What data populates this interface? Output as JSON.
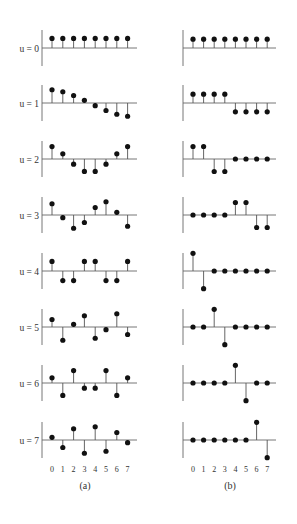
{
  "chart_data": [
    {
      "type": "stem",
      "title": "",
      "caption": "(a)",
      "description": "8-point DCT basis functions",
      "x": [
        0,
        1,
        2,
        3,
        4,
        5,
        6,
        7
      ],
      "xlabel": "",
      "ylabel": "",
      "tick_labels": [
        "0",
        "1",
        "2",
        "3",
        "4",
        "5",
        "6",
        "7"
      ],
      "series": [
        {
          "name": "u = 0",
          "values": [
            0.354,
            0.354,
            0.354,
            0.354,
            0.354,
            0.354,
            0.354,
            0.354
          ]
        },
        {
          "name": "u = 1",
          "values": [
            0.49,
            0.416,
            0.278,
            0.098,
            -0.098,
            -0.278,
            -0.416,
            -0.49
          ]
        },
        {
          "name": "u = 2",
          "values": [
            0.462,
            0.191,
            -0.191,
            -0.462,
            -0.462,
            -0.191,
            0.191,
            0.462
          ]
        },
        {
          "name": "u = 3",
          "values": [
            0.416,
            -0.098,
            -0.49,
            -0.278,
            0.278,
            0.49,
            0.098,
            -0.416
          ]
        },
        {
          "name": "u = 4",
          "values": [
            0.354,
            -0.354,
            -0.354,
            0.354,
            0.354,
            -0.354,
            -0.354,
            0.354
          ]
        },
        {
          "name": "u = 5",
          "values": [
            0.278,
            -0.49,
            0.098,
            0.416,
            -0.416,
            -0.098,
            0.49,
            -0.278
          ]
        },
        {
          "name": "u = 6",
          "values": [
            0.191,
            -0.462,
            0.462,
            -0.191,
            -0.191,
            0.462,
            -0.462,
            0.191
          ]
        },
        {
          "name": "u = 7",
          "values": [
            0.098,
            -0.278,
            0.416,
            -0.49,
            0.49,
            -0.416,
            0.278,
            -0.098
          ]
        }
      ]
    },
    {
      "type": "stem",
      "title": "",
      "caption": "(b)",
      "description": "8-point Haar basis functions",
      "x": [
        0,
        1,
        2,
        3,
        4,
        5,
        6,
        7
      ],
      "xlabel": "",
      "ylabel": "",
      "tick_labels": [
        "0",
        "1",
        "2",
        "3",
        "4",
        "5",
        "6",
        "7"
      ],
      "series": [
        {
          "name": "u = 0",
          "values": [
            0.354,
            0.354,
            0.354,
            0.354,
            0.354,
            0.354,
            0.354,
            0.354
          ]
        },
        {
          "name": "u = 1",
          "values": [
            0.354,
            0.354,
            0.354,
            0.354,
            -0.354,
            -0.354,
            -0.354,
            -0.354
          ]
        },
        {
          "name": "u = 2",
          "values": [
            0.5,
            0.5,
            -0.5,
            -0.5,
            0,
            0,
            0,
            0
          ]
        },
        {
          "name": "u = 3",
          "values": [
            0,
            0,
            0,
            0,
            0.5,
            0.5,
            -0.5,
            -0.5
          ]
        },
        {
          "name": "u = 4",
          "values": [
            0.707,
            -0.707,
            0,
            0,
            0,
            0,
            0,
            0
          ]
        },
        {
          "name": "u = 5",
          "values": [
            0,
            0,
            0.707,
            -0.707,
            0,
            0,
            0,
            0
          ]
        },
        {
          "name": "u = 6",
          "values": [
            0,
            0,
            0,
            0,
            0.707,
            -0.707,
            0,
            0
          ]
        },
        {
          "name": "u = 7",
          "values": [
            0,
            0,
            0,
            0,
            0,
            0,
            0.707,
            -0.707
          ]
        }
      ]
    }
  ],
  "row_labels": [
    "u = 0",
    "u = 1",
    "u = 2",
    "u = 3",
    "u = 4",
    "u = 5",
    "u = 6",
    "u = 7"
  ],
  "colors": {
    "stem": "#555555",
    "marker": "#111111",
    "axis": "#666666"
  }
}
